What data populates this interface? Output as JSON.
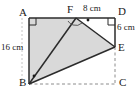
{
  "figure": {
    "type": "geometry-diagram",
    "background_color": "#ffffff",
    "shading_color": "#d9d9d9",
    "line_color": "#2b2b2b",
    "dashed_color": "#8c8c8c",
    "vertices": [
      {
        "name": "A",
        "label": "A",
        "x": 29,
        "y": 18,
        "label_x": 19,
        "label_y": 8
      },
      {
        "name": "F",
        "label": "F",
        "x": 76,
        "y": 18,
        "label_x": 68,
        "label_y": 5
      },
      {
        "name": "D",
        "label": "D",
        "x": 115,
        "y": 18,
        "label_x": 118,
        "label_y": 7
      },
      {
        "name": "E",
        "label": "E",
        "x": 115,
        "y": 47,
        "label_x": 118,
        "label_y": 43
      },
      {
        "name": "C",
        "label": "C",
        "x": 115,
        "y": 84,
        "label_x": 119,
        "label_y": 78
      },
      {
        "name": "B",
        "label": "B",
        "x": 29,
        "y": 84,
        "label_x": 19,
        "label_y": 78
      }
    ],
    "solid_edges": [
      {
        "name": "edge-AD",
        "from": "A",
        "to": "D"
      },
      {
        "name": "edge-AB",
        "from": "A",
        "to": "B"
      },
      {
        "name": "edge-BF",
        "from": "B",
        "to": "F"
      },
      {
        "name": "edge-FE",
        "from": "F",
        "to": "E"
      },
      {
        "name": "edge-BE",
        "from": "B",
        "to": "E"
      },
      {
        "name": "edge-DE",
        "from": "D",
        "to": "E"
      }
    ],
    "dashed_edges": [
      {
        "name": "edge-BC",
        "from": "B",
        "to": "C"
      },
      {
        "name": "edge-EC",
        "from": "E",
        "to": "C"
      }
    ],
    "shaded_polygon": {
      "name": "shaded-region-AFEB",
      "points": "A,F,E,B"
    },
    "right_angles": [
      {
        "name": "right-angle-A",
        "at": "A"
      },
      {
        "name": "right-angle-D",
        "at": "D"
      }
    ],
    "angle_arcs": [
      {
        "name": "angle-arc-BFA",
        "at": "F"
      },
      {
        "name": "angle-arc-BFE",
        "at": "F"
      }
    ],
    "dot_marks": [
      {
        "name": "dot-mark-F",
        "at": "F"
      },
      {
        "name": "dot-mark-B",
        "at": "B"
      }
    ],
    "dimension_guides": [
      {
        "name": "guide-left-16cm",
        "orientation": "vertical"
      }
    ]
  },
  "dimensions": {
    "left_side": {
      "text": "16 cm",
      "value": 16,
      "unit": "cm",
      "edge": "AB",
      "x": 2,
      "y": 46
    },
    "top_side": {
      "text": "8 cm",
      "value": 8,
      "unit": "cm",
      "edge": "FD",
      "x": 84,
      "y": 6
    },
    "right_side": {
      "text": "6 cm",
      "value": 6,
      "unit": "cm",
      "edge": "DE",
      "x": 117,
      "y": 26
    }
  }
}
